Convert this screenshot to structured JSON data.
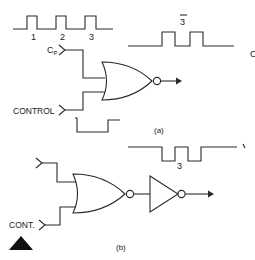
{
  "figure": {
    "type": "logic gate clock gating diagram",
    "colors": {
      "line": "#2a2a2a",
      "text": "#222222",
      "background": "#ffffff"
    },
    "part_a": {
      "caption": "(a)",
      "clock_waveform": {
        "pulse_labels": [
          "1",
          "2",
          "3"
        ]
      },
      "inputs": {
        "clock_label_main": "C",
        "clock_label_sub": "P",
        "control_label": "CONTROL"
      },
      "gate": "NOR",
      "output_waveform": {
        "label": "3",
        "label_overbar": true,
        "trailing_label": "C"
      }
    },
    "part_b": {
      "caption": "(b)",
      "inputs": {
        "top_label": "",
        "control_label": "CONT."
      },
      "gates": [
        "NOR",
        "NOT"
      ],
      "output_waveform": {
        "label": "3",
        "trailing_mark": "\\"
      }
    },
    "corner_marker": "black-triangle"
  }
}
